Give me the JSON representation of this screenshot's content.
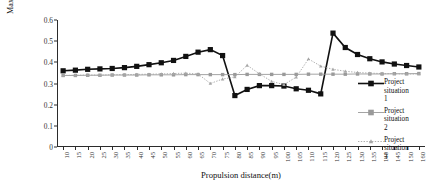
{
  "chart_data": {
    "type": "line",
    "title": "",
    "xlabel": "Propulsion distance(m)",
    "ylabel_lines": [
      "Maximum value of the first principal",
      "stress（MPa）"
    ],
    "ylabel": "Maximum value of the first principal stress (MPa)",
    "x": [
      10,
      15,
      20,
      25,
      30,
      35,
      40,
      45,
      50,
      55,
      60,
      65,
      70,
      75,
      80,
      85,
      90,
      95,
      100,
      105,
      110,
      115,
      120,
      125,
      130,
      135,
      140,
      145,
      150,
      160
    ],
    "xtick_labels": [
      "10",
      "15",
      "20",
      "25",
      "30",
      "35",
      "40",
      "45",
      "50",
      "55",
      "60",
      "65",
      "70",
      "75",
      "80",
      "85",
      "90",
      "95",
      "100",
      "105",
      "110",
      "115",
      "120",
      "125",
      "130",
      "135",
      "140",
      "145",
      "150",
      "160"
    ],
    "ytick_labels": [
      "0",
      "0.1",
      "0.2",
      "0.3",
      "0.4",
      "0.5",
      "0.6"
    ],
    "ytick_values": [
      0,
      0.1,
      0.2,
      0.3,
      0.4,
      0.5,
      0.6
    ],
    "ylim": [
      0,
      0.6
    ],
    "grid": false,
    "legend_position": "right",
    "series": [
      {
        "name": "Project situation 1",
        "name_lines": [
          "Project",
          "situation",
          "1"
        ],
        "color": "#111111",
        "marker": "square-filled",
        "linestyle": "solid",
        "linewidth": 1.6,
        "values": [
          0.36,
          0.363,
          0.367,
          0.369,
          0.371,
          0.375,
          0.381,
          0.389,
          0.398,
          0.409,
          0.428,
          0.448,
          0.46,
          0.432,
          0.243,
          0.272,
          0.29,
          0.29,
          0.288,
          0.275,
          0.268,
          0.251,
          0.538,
          0.47,
          0.437,
          0.417,
          0.402,
          0.392,
          0.385,
          0.378
        ]
      },
      {
        "name": "Project situation 2",
        "name_lines": [
          "Project",
          "situation",
          "2"
        ],
        "color": "#9a9a9a",
        "marker": "square-filled",
        "linestyle": "solid",
        "linewidth": 0.9,
        "values": [
          0.338,
          0.338,
          0.339,
          0.339,
          0.34,
          0.34,
          0.34,
          0.341,
          0.341,
          0.341,
          0.342,
          0.342,
          0.342,
          0.342,
          0.342,
          0.343,
          0.343,
          0.343,
          0.343,
          0.343,
          0.344,
          0.344,
          0.344,
          0.344,
          0.345,
          0.345,
          0.345,
          0.346,
          0.346,
          0.347
        ]
      },
      {
        "name": "Project situation 3",
        "name_lines": [
          "Project",
          "situation",
          "3"
        ],
        "color": "#a6a6a6",
        "marker": "triangle",
        "linestyle": "dotted",
        "linewidth": 0.9,
        "values": [
          0.338,
          0.339,
          0.34,
          0.34,
          0.341,
          0.342,
          0.343,
          0.344,
          0.345,
          0.347,
          0.349,
          0.345,
          0.3,
          0.321,
          0.331,
          0.386,
          0.346,
          0.31,
          0.295,
          0.33,
          0.416,
          0.382,
          0.367,
          0.358,
          0.352,
          0.349,
          0.347,
          0.346,
          0.345,
          0.345
        ]
      }
    ]
  }
}
